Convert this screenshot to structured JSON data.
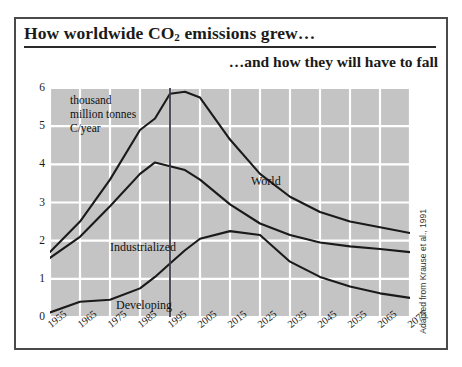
{
  "figure": {
    "main_title_prefix": "How worldwide CO",
    "main_title_sub": "2",
    "main_title_suffix": " emissions grew…",
    "sub_title": "…and how they will have to fall",
    "source_credit": "Adapted from Krause et al., 1991",
    "axis_note": "thousand\nmillion tonnes\nC/year"
  },
  "colors": {
    "plot_background": "#c4c4c4",
    "gridline": "#ffffff",
    "curve": "#1a1a1a",
    "marker_line": "#3a3a4a",
    "frame": "#4a4a4a",
    "page_background": "#ffffff"
  },
  "chart_data": {
    "type": "line",
    "subtitle": "…and how they will have to fall",
    "xlabel": "",
    "ylabel": "thousand million tonnes C/year",
    "xlim": [
      1955,
      2075
    ],
    "ylim": [
      0,
      6
    ],
    "grid": true,
    "legend": "inline-labels",
    "xticks": [
      "1955",
      "1965",
      "1975",
      "1985",
      "1995",
      "2005",
      "2015",
      "2025",
      "2035",
      "2045",
      "2055",
      "2065",
      "2075"
    ],
    "yticks": [
      "0",
      "1",
      "2",
      "3",
      "4",
      "5",
      "6"
    ],
    "x": [
      1955,
      1965,
      1975,
      1985,
      1990,
      1995,
      2000,
      2005,
      2015,
      2025,
      2035,
      2045,
      2055,
      2065,
      2075
    ],
    "annotations": [
      {
        "text": "thousand million tonnes C/year",
        "x": 1960,
        "y": 5.7
      },
      {
        "text": "present-day marker line",
        "x": 1995,
        "y": 6.0
      }
    ],
    "marker_line_x": 1995,
    "series": [
      {
        "name": "World",
        "values": [
          1.7,
          2.5,
          3.6,
          4.9,
          5.2,
          5.85,
          5.9,
          5.75,
          4.65,
          3.75,
          3.15,
          2.75,
          2.5,
          2.35,
          2.2
        ]
      },
      {
        "name": "Industrialized",
        "values": [
          1.55,
          2.1,
          2.9,
          3.75,
          4.05,
          3.95,
          3.85,
          3.6,
          2.95,
          2.45,
          2.15,
          1.95,
          1.85,
          1.78,
          1.7
        ]
      },
      {
        "name": "Developing",
        "values": [
          0.12,
          0.4,
          0.45,
          0.75,
          1.05,
          1.4,
          1.75,
          2.05,
          2.25,
          2.15,
          1.45,
          1.05,
          0.8,
          0.62,
          0.5
        ]
      }
    ]
  }
}
